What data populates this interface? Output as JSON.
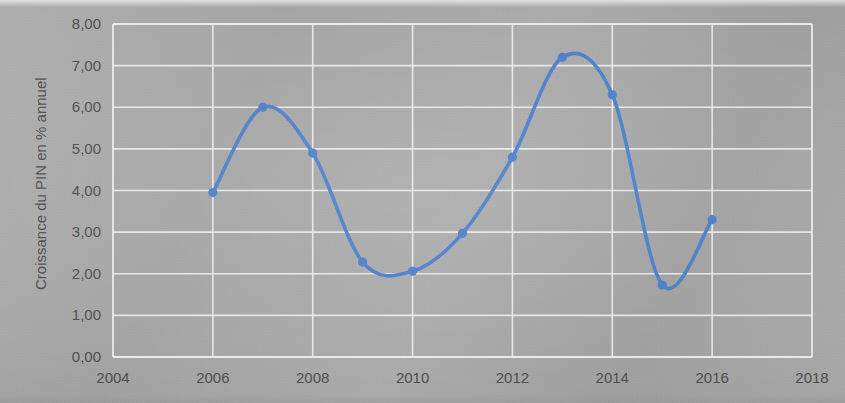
{
  "chart_data": {
    "type": "line",
    "title": "",
    "subtitle": "",
    "xlabel": "",
    "ylabel": "Croissance du PIN en % annuel",
    "x": [
      2006,
      2007,
      2008,
      2009,
      2010,
      2011,
      2012,
      2013,
      2014,
      2015,
      2016
    ],
    "series": [
      {
        "name": "Croissance du PIN en % annuel",
        "color": "#4a7ec8",
        "values": [
          3.95,
          6.0,
          4.9,
          2.28,
          2.06,
          2.97,
          4.8,
          7.2,
          6.3,
          1.73,
          3.3
        ]
      }
    ],
    "xlim": [
      2004,
      2018
    ],
    "ylim": [
      0.0,
      8.0
    ],
    "xticks": [
      2004,
      2006,
      2008,
      2010,
      2012,
      2014,
      2016,
      2018
    ],
    "xtick_labels": [
      "2004",
      "2006",
      "2008",
      "2010",
      "2012",
      "2014",
      "2016",
      "2018"
    ],
    "yticks": [
      0.0,
      1.0,
      2.0,
      3.0,
      4.0,
      5.0,
      6.0,
      7.0,
      8.0
    ],
    "ytick_labels": [
      "0,00",
      "1,00",
      "2,00",
      "3,00",
      "4,00",
      "5,00",
      "6,00",
      "7,00",
      "8,00"
    ],
    "grid": "both",
    "legend": "none",
    "smoothing": "spline",
    "marker": "circle",
    "background_color": "#a9a9a9",
    "gridline_color": "#efefef",
    "text_color": "#4e4e4e"
  },
  "axes": {
    "y_title": "Croissance du PIN en % annuel"
  }
}
